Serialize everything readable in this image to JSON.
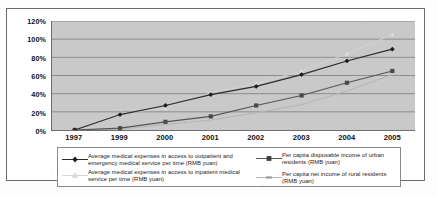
{
  "chart_data": {
    "type": "line",
    "title": "",
    "subtitle": "",
    "xlabel": "",
    "ylabel": "",
    "grid": true,
    "legend_position": "bottom",
    "categories": [
      "1997",
      "1999",
      "2000",
      "2001",
      "2002",
      "2003",
      "2004",
      "2005"
    ],
    "ylim": [
      0,
      120
    ],
    "ytick_labels": [
      "0%",
      "20%",
      "40%",
      "60%",
      "80%",
      "100%",
      "120%"
    ],
    "ytick_values": [
      0,
      20,
      40,
      60,
      80,
      100,
      120
    ],
    "series": [
      {
        "name": "Average medical expenses in access to outpatient and emergency medical service per time (RMB yuan)",
        "marker": "diamond",
        "color": "#2b2b2b",
        "values": [
          0,
          17,
          27,
          39,
          48,
          61,
          76,
          89
        ]
      },
      {
        "name": "Average medical expenses in access to inpatient medical service per time (RMB yuan)",
        "marker": "triangle",
        "color": "#d2d2d2",
        "values": [
          0,
          18,
          24,
          41,
          51,
          65,
          84,
          105
        ]
      },
      {
        "name": "Per capita disposable income of urban residents (RMB yuan)",
        "marker": "square",
        "color": "#555555",
        "values": [
          0,
          2,
          9,
          15,
          27,
          38,
          52,
          65
        ]
      },
      {
        "name": "Per capita net income of rural residents (RMB yuan)",
        "marker": "none",
        "color": "#b4b4b4",
        "values": [
          0,
          1,
          6,
          11,
          19,
          28,
          43,
          61
        ]
      }
    ]
  },
  "axes": {
    "y_ticks": [
      {
        "label": "120%",
        "value": 120
      },
      {
        "label": "100%",
        "value": 100
      },
      {
        "label": "80%",
        "value": 80
      },
      {
        "label": "60%",
        "value": 60
      },
      {
        "label": "40%",
        "value": 40
      },
      {
        "label": "20%",
        "value": 20
      },
      {
        "label": "0%",
        "value": 0
      }
    ],
    "x_ticks": [
      {
        "label": "1997"
      },
      {
        "label": "1999"
      },
      {
        "label": "2000"
      },
      {
        "label": "2001"
      },
      {
        "label": "2002"
      },
      {
        "label": "2003"
      },
      {
        "label": "2004"
      },
      {
        "label": "2005"
      }
    ]
  },
  "legend": {
    "items": [
      {
        "label": "Average medical expenses in access to outpatient and emergency medical service per time (RMB yuan)",
        "marker": "diamond",
        "color": "#2b2b2b"
      },
      {
        "label": "Average medical expenses in access to inpatient medical service per time (RMB yuan)",
        "marker": "triangle",
        "color": "#d2d2d2"
      },
      {
        "label": "Per capita disposable income of urban residents (RMB yuan)",
        "marker": "square",
        "color": "#555555"
      },
      {
        "label": "Per capita net income of rural residents (RMB yuan)",
        "marker": "line",
        "color": "#b4b4b4"
      }
    ]
  },
  "style": {
    "plot_background": "#c9c9c9",
    "gridline_color": "#7d7d7d",
    "axis_color": "#6e6e6e",
    "frame_color": "#6b6b6b",
    "page_background": "#ffffff"
  }
}
